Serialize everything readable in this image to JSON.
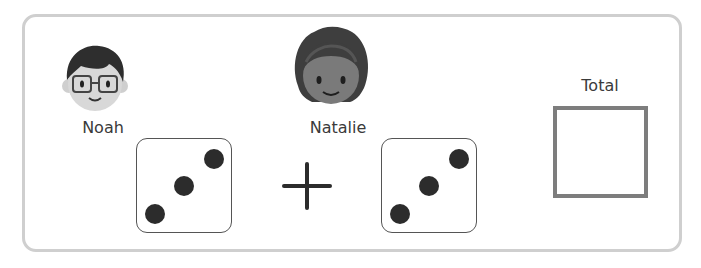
{
  "players": [
    {
      "name": "Noah",
      "avatar": "boy-with-glasses-avatar",
      "die_value": 3
    },
    {
      "name": "Natalie",
      "avatar": "girl-with-curly-hair-avatar",
      "die_value": 3
    }
  ],
  "operator": "+",
  "total": {
    "label": "Total",
    "value": ""
  },
  "colors": {
    "frame": "#cfcfcf",
    "pip": "#2c2c2c",
    "total_border": "#7d7d7d"
  }
}
